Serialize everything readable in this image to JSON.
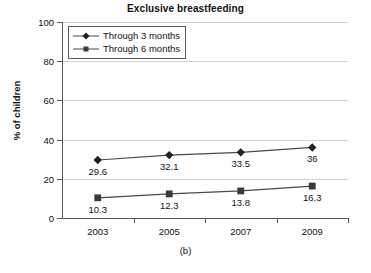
{
  "chart_data": {
    "type": "line",
    "title": "Exclusive breastfeeding",
    "xlabel": "",
    "ylabel": "% of children",
    "categories": [
      "2003",
      "2005",
      "2007",
      "2009"
    ],
    "series": [
      {
        "name": "Through 3 months",
        "marker": "diamond",
        "values": [
          29.6,
          32.1,
          33.5,
          36
        ],
        "labels": [
          "29.6",
          "32.1",
          "33.5",
          "36"
        ]
      },
      {
        "name": "Through 6 months",
        "marker": "square",
        "values": [
          10.3,
          12.3,
          13.8,
          16.3
        ],
        "labels": [
          "10.3",
          "12.3",
          "13.8",
          "16.3"
        ]
      }
    ],
    "ylim": [
      0,
      100
    ],
    "yticks": [
      0,
      20,
      40,
      60,
      80,
      100
    ],
    "ytick_labels": [
      "0",
      "20",
      "40",
      "60",
      "80",
      "100"
    ],
    "grid": true,
    "legend_position": "top-left",
    "colors": {
      "series_1": "#222222",
      "series_2": "#3a3a3a",
      "line": "#4a4a4a",
      "gridline": "#d2d2d2",
      "axis": "#555555",
      "text": "#111111",
      "background": "#ffffff"
    }
  },
  "caption": "(b)"
}
